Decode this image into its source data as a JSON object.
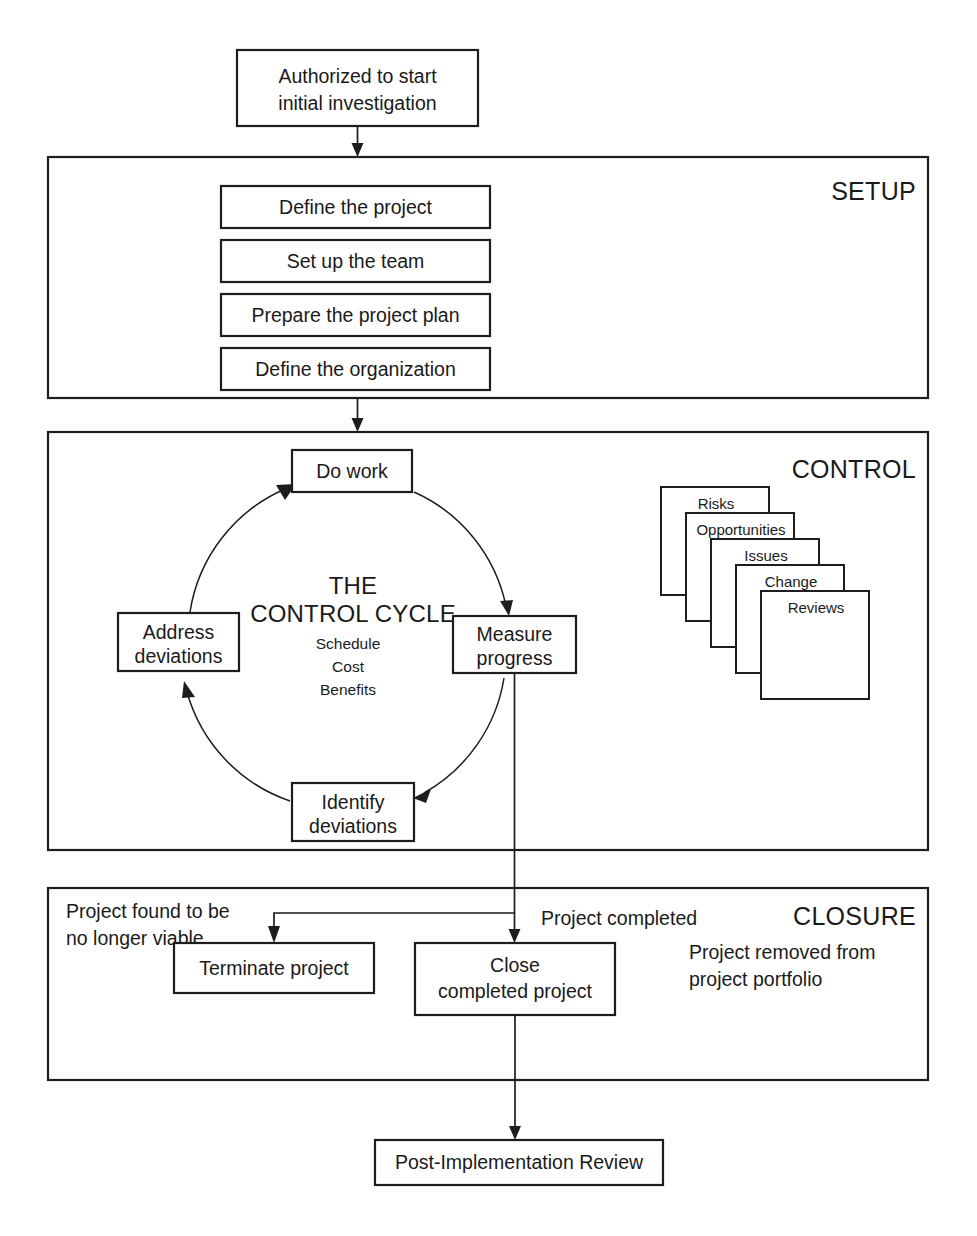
{
  "diagram": {
    "entry": {
      "label_line1": "Authorized to start",
      "label_line2": "initial investigation"
    },
    "sections": [
      {
        "id": "setup",
        "heading": "SETUP",
        "steps": [
          {
            "label": "Define the project"
          },
          {
            "label": "Set up the team"
          },
          {
            "label": "Prepare the project plan"
          },
          {
            "label": "Define the organization"
          }
        ]
      },
      {
        "id": "control",
        "heading": "CONTROL",
        "cycle": {
          "title_line1": "THE",
          "title_line2": "CONTROL CYCLE",
          "sub_items": [
            "Schedule",
            "Cost",
            "Benefits"
          ],
          "nodes": [
            {
              "id": "do-work",
              "label_line1": "Do work",
              "label_line2": ""
            },
            {
              "id": "measure-progress",
              "label_line1": "Measure",
              "label_line2": "progress"
            },
            {
              "id": "identify-deviations",
              "label_line1": "Identify",
              "label_line2": "deviations"
            },
            {
              "id": "address-deviations",
              "label_line1": "Address",
              "label_line2": "deviations"
            }
          ]
        },
        "cards": [
          {
            "label": "Risks"
          },
          {
            "label": "Opportunities"
          },
          {
            "label": "Issues"
          },
          {
            "label": "Change"
          },
          {
            "label": "Reviews"
          }
        ]
      },
      {
        "id": "closure",
        "heading": "CLOSURE",
        "notes": [
          {
            "id": "not-viable",
            "line1": "Project found to be",
            "line2": "no longer viable"
          },
          {
            "id": "completed",
            "line1": "Project completed",
            "line2": ""
          },
          {
            "id": "removed-from-portfolio",
            "line1": "Project removed from",
            "line2": "project portfolio"
          }
        ],
        "steps": [
          {
            "id": "terminate",
            "label_line1": "Terminate project",
            "label_line2": ""
          },
          {
            "id": "close",
            "label_line1": "Close",
            "label_line2": "completed project"
          }
        ]
      }
    ],
    "exit": {
      "label": "Post-Implementation Review"
    },
    "colors": {
      "stroke": "#1d1d1d",
      "text": "#1a1a1a",
      "background": "#ffffff"
    }
  }
}
